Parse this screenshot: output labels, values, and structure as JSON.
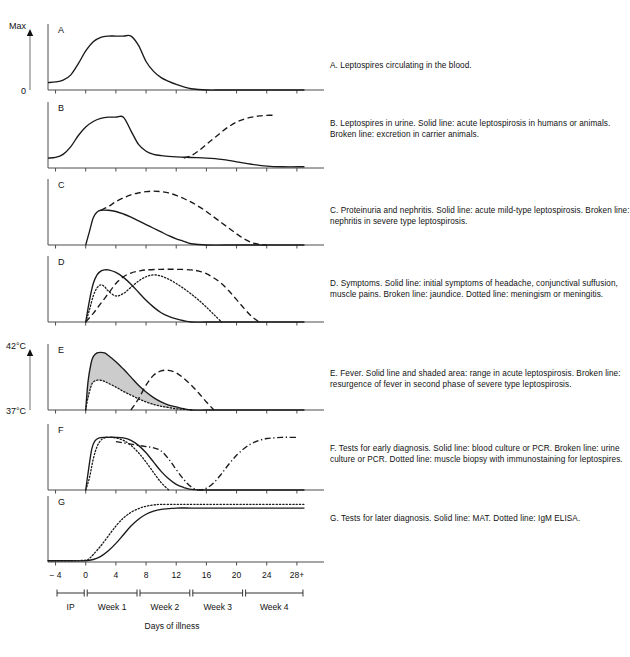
{
  "figure": {
    "xlabel": "Days of illness",
    "axis": {
      "y_top_label": "Max",
      "y_bottom_label": "0",
      "y_top_label_e": "42°C",
      "y_bottom_label_e": "37°C"
    },
    "ticks": [
      "− 4",
      "0",
      "4",
      "8",
      "12",
      "16",
      "20",
      "24",
      "28+"
    ],
    "tick_values": [
      -4,
      0,
      4,
      8,
      12,
      16,
      20,
      24,
      28
    ],
    "periods": [
      {
        "label": "IP",
        "start": -4,
        "end": 0
      },
      {
        "label": "Week 1",
        "start": 0,
        "end": 7
      },
      {
        "label": "Week 2",
        "start": 7,
        "end": 14
      },
      {
        "label": "Week 3",
        "start": 14,
        "end": 21
      },
      {
        "label": "Week 4",
        "start": 21,
        "end": 29
      }
    ]
  },
  "colors": {
    "line": "#1a1a1a",
    "axis": "#4d4d4d",
    "shade": "#cccccc",
    "text": "#111111"
  },
  "chart_data": {
    "type": "line",
    "xlabel": "Days of illness",
    "ylabel": "Max",
    "xlim": [
      -5,
      30
    ],
    "ylim": [
      0,
      1
    ],
    "grid": false,
    "legend": "none",
    "panels": [
      {
        "id": "A",
        "letter": "A",
        "caption": "A. Leptospires circulating in the blood.",
        "ylabel_top": "Max",
        "ylabel_bottom": "0",
        "series": [
          {
            "name": "Leptospires in blood",
            "style": "solid",
            "x": [
              -5,
              -4,
              -3,
              -2,
              -1,
              0,
              1,
              2,
              3,
              4,
              5,
              6,
              7,
              8,
              9,
              10,
              11,
              12,
              13,
              14,
              16,
              18,
              20,
              24,
              29
            ],
            "y": [
              0.12,
              0.13,
              0.16,
              0.24,
              0.42,
              0.63,
              0.78,
              0.85,
              0.87,
              0.87,
              0.87,
              0.87,
              0.72,
              0.46,
              0.3,
              0.2,
              0.14,
              0.09,
              0.05,
              0.02,
              0.0,
              0.0,
              0.0,
              0.0,
              0.0
            ]
          }
        ]
      },
      {
        "id": "B",
        "letter": "B",
        "caption": "B. Leptospires in urine.  Solid line: acute leptospirosis in humans or animals. Broken line: excretion in carrier animals.",
        "series": [
          {
            "name": "Acute leptospirosis (humans or animals)",
            "style": "solid",
            "x": [
              -5,
              -4,
              -3,
              -2,
              -1,
              0,
              1,
              2,
              3,
              4,
              5,
              6,
              7,
              8,
              9,
              10,
              12,
              14,
              16,
              18,
              20,
              22,
              24,
              26,
              29
            ],
            "y": [
              0.16,
              0.17,
              0.22,
              0.34,
              0.52,
              0.66,
              0.75,
              0.8,
              0.82,
              0.82,
              0.82,
              0.6,
              0.38,
              0.27,
              0.22,
              0.2,
              0.18,
              0.17,
              0.16,
              0.14,
              0.1,
              0.06,
              0.03,
              0.02,
              0.02
            ]
          },
          {
            "name": "Excretion in carrier animals",
            "style": "dashed",
            "x": [
              13,
              14,
              15,
              16,
              17,
              18,
              19,
              20,
              21,
              22,
              23,
              24,
              25
            ],
            "y": [
              0.16,
              0.2,
              0.28,
              0.38,
              0.48,
              0.58,
              0.67,
              0.74,
              0.79,
              0.82,
              0.84,
              0.85,
              0.85
            ]
          }
        ]
      },
      {
        "id": "C",
        "letter": "C",
        "caption": "C. Proteinuria and nephritis.  Solid line: acute mild-type leptospirosis.  Broken line: nephritis in severe type leptospirosis.",
        "series": [
          {
            "name": "Acute mild-type leptospirosis",
            "style": "solid",
            "x": [
              0,
              0.5,
              1,
              1.5,
              2,
              3,
              4,
              5,
              6,
              7,
              8,
              9,
              10,
              11,
              12,
              13,
              14,
              16,
              20,
              24,
              29
            ],
            "y": [
              0.0,
              0.22,
              0.44,
              0.53,
              0.56,
              0.56,
              0.54,
              0.5,
              0.45,
              0.39,
              0.33,
              0.27,
              0.21,
              0.15,
              0.1,
              0.06,
              0.02,
              0.0,
              0.0,
              0.0,
              0.0
            ]
          },
          {
            "name": "Nephritis in severe type leptospirosis",
            "style": "dashed",
            "x": [
              2,
              3,
              4,
              5,
              6,
              7,
              8,
              9,
              10,
              11,
              12,
              13,
              14,
              15,
              16,
              17,
              18,
              19,
              20,
              21,
              22,
              23,
              24
            ],
            "y": [
              0.56,
              0.62,
              0.7,
              0.76,
              0.81,
              0.84,
              0.86,
              0.87,
              0.86,
              0.84,
              0.8,
              0.75,
              0.69,
              0.62,
              0.54,
              0.45,
              0.36,
              0.27,
              0.18,
              0.1,
              0.04,
              0.01,
              0.0
            ]
          }
        ]
      },
      {
        "id": "D",
        "letter": "D",
        "caption": "D. Symptoms.  Solid line: initial symptoms of headache, conjunctival suffusion, muscle pains. Broken line: jaundice.  Dotted line: meningism or meningitis.",
        "series": [
          {
            "name": "Initial symptoms (headache, conjunctival suffusion, muscle pains)",
            "style": "solid",
            "x": [
              0,
              0.5,
              1,
              1.5,
              2,
              2.5,
              3,
              4,
              5,
              6,
              7,
              8,
              9,
              10,
              11,
              12,
              13,
              14,
              16,
              20,
              29
            ],
            "y": [
              0.0,
              0.35,
              0.62,
              0.76,
              0.82,
              0.84,
              0.84,
              0.8,
              0.72,
              0.61,
              0.48,
              0.35,
              0.24,
              0.15,
              0.09,
              0.05,
              0.02,
              0.0,
              0.0,
              0.0,
              0.0
            ]
          },
          {
            "name": "Jaundice",
            "style": "dashed",
            "x": [
              0,
              1,
              2,
              3,
              4,
              5,
              6,
              7,
              8,
              10,
              12,
              14,
              15,
              16,
              17,
              18,
              19,
              20,
              21,
              22,
              23
            ],
            "y": [
              0.0,
              0.14,
              0.3,
              0.46,
              0.62,
              0.73,
              0.79,
              0.82,
              0.84,
              0.85,
              0.85,
              0.84,
              0.82,
              0.78,
              0.71,
              0.62,
              0.5,
              0.36,
              0.22,
              0.09,
              0.0
            ]
          },
          {
            "name": "Meningism or meningitis",
            "style": "dotted",
            "x": [
              0,
              0.5,
              1,
              1.5,
              2,
              2.5,
              3,
              4,
              5,
              6,
              7,
              8,
              9,
              10,
              11,
              12,
              13,
              14,
              15,
              16,
              17,
              18
            ],
            "y": [
              0.0,
              0.2,
              0.42,
              0.55,
              0.6,
              0.57,
              0.5,
              0.42,
              0.46,
              0.56,
              0.66,
              0.73,
              0.76,
              0.74,
              0.69,
              0.62,
              0.54,
              0.45,
              0.35,
              0.24,
              0.12,
              0.0
            ]
          }
        ]
      },
      {
        "id": "E",
        "letter": "E",
        "caption": "E. Fever.  Solid line and shaded area: range in acute leptospirosis. Broken line: resurgence of fever in second phase of severe type leptospirosis.",
        "ylabel_top": "42°C",
        "ylabel_bottom": "37°C",
        "shaded": true,
        "series": [
          {
            "name": "Fever range upper bound (acute leptospirosis)",
            "style": "solid",
            "x": [
              0,
              0.3,
              0.7,
              1,
              1.5,
              2,
              2.5,
              3,
              4,
              5,
              6,
              7,
              8,
              9,
              10,
              11,
              12,
              13,
              14,
              16,
              20,
              29
            ],
            "y": [
              0.0,
              0.45,
              0.75,
              0.86,
              0.92,
              0.93,
              0.92,
              0.88,
              0.78,
              0.66,
              0.53,
              0.4,
              0.29,
              0.2,
              0.13,
              0.08,
              0.05,
              0.02,
              0.0,
              0.0,
              0.0,
              0.0
            ]
          },
          {
            "name": "Fever range lower bound (acute leptospirosis)",
            "style": "dotted",
            "x": [
              0,
              0.3,
              0.7,
              1,
              1.5,
              2,
              2.5,
              3,
              4,
              5,
              6,
              7,
              8,
              9,
              10,
              11,
              12,
              13,
              14
            ],
            "y": [
              0.0,
              0.2,
              0.38,
              0.45,
              0.48,
              0.48,
              0.46,
              0.43,
              0.37,
              0.3,
              0.24,
              0.18,
              0.13,
              0.09,
              0.06,
              0.04,
              0.02,
              0.01,
              0.0
            ]
          },
          {
            "name": "Resurgence of fever in second phase (severe type)",
            "style": "dashed",
            "x": [
              6,
              7,
              8,
              9,
              10,
              11,
              12,
              13,
              14,
              15,
              16,
              17
            ],
            "y": [
              0.0,
              0.18,
              0.4,
              0.56,
              0.63,
              0.64,
              0.6,
              0.51,
              0.4,
              0.27,
              0.13,
              0.0
            ]
          }
        ]
      },
      {
        "id": "F",
        "letter": "F",
        "caption": "F.  Tests for early diagnosis.  Solid line: blood culture or PCR.  Broken line: urine culture or PCR.  Dotted line: muscle biopsy with immunostaining for leptospires.",
        "series": [
          {
            "name": "Blood culture or PCR",
            "style": "solid",
            "x": [
              0,
              0.4,
              0.8,
              1.2,
              1.8,
              2.5,
              3,
              4,
              5,
              6,
              7,
              8,
              9,
              10,
              11,
              12,
              13,
              14,
              16,
              20,
              29
            ],
            "y": [
              0.0,
              0.35,
              0.66,
              0.79,
              0.84,
              0.85,
              0.85,
              0.85,
              0.84,
              0.8,
              0.72,
              0.6,
              0.45,
              0.3,
              0.18,
              0.09,
              0.04,
              0.01,
              0.0,
              0.0,
              0.0
            ]
          },
          {
            "name": "Urine culture or PCR",
            "style": "dashdot",
            "x": [
              4,
              5,
              6,
              7,
              8,
              9,
              10,
              11,
              12,
              13,
              14,
              15,
              16,
              17,
              18,
              19,
              20,
              21,
              22,
              23,
              24,
              25,
              26,
              27,
              28
            ],
            "y": [
              0.78,
              0.76,
              0.74,
              0.72,
              0.7,
              0.68,
              0.63,
              0.5,
              0.33,
              0.17,
              0.05,
              0.0,
              0.03,
              0.12,
              0.26,
              0.42,
              0.56,
              0.67,
              0.75,
              0.8,
              0.83,
              0.84,
              0.85,
              0.85,
              0.85
            ]
          },
          {
            "name": "Muscle biopsy with immunostaining",
            "style": "dotted",
            "x": [
              0,
              0.5,
              1,
              1.5,
              2,
              2.5,
              3,
              4,
              5,
              6,
              7,
              8,
              9,
              10,
              11
            ],
            "y": [
              0.0,
              0.2,
              0.5,
              0.7,
              0.8,
              0.84,
              0.85,
              0.84,
              0.8,
              0.72,
              0.6,
              0.45,
              0.28,
              0.12,
              0.0
            ]
          }
        ]
      },
      {
        "id": "G",
        "letter": "G",
        "caption": "G. Tests for later diagnosis.  Solid line: MAT. Dotted line: IgM ELISA.",
        "series": [
          {
            "name": "MAT",
            "style": "solid",
            "x": [
              -5,
              -2,
              0,
              1,
              2,
              3,
              4,
              5,
              6,
              7,
              8,
              9,
              10,
              11,
              12,
              14,
              16,
              20,
              24,
              29
            ],
            "y": [
              0.02,
              0.02,
              0.02,
              0.04,
              0.09,
              0.18,
              0.3,
              0.44,
              0.58,
              0.69,
              0.77,
              0.82,
              0.85,
              0.86,
              0.87,
              0.87,
              0.87,
              0.87,
              0.87,
              0.87
            ]
          },
          {
            "name": "IgM ELISA",
            "style": "dotted",
            "x": [
              -5,
              -2,
              0,
              0.5,
              1,
              2,
              3,
              4,
              5,
              6,
              7,
              8,
              9,
              10,
              12,
              14,
              16,
              20,
              24,
              29
            ],
            "y": [
              0.02,
              0.02,
              0.03,
              0.06,
              0.12,
              0.26,
              0.42,
              0.58,
              0.71,
              0.8,
              0.86,
              0.9,
              0.92,
              0.93,
              0.93,
              0.93,
              0.93,
              0.93,
              0.93,
              0.93
            ]
          }
        ]
      }
    ]
  }
}
